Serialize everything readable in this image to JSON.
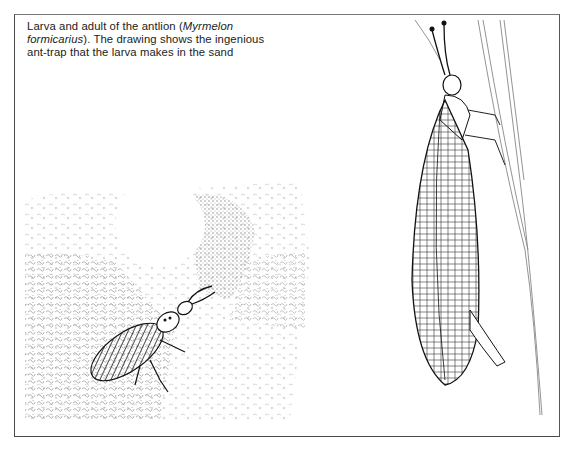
{
  "figure": {
    "caption": {
      "text_before_1": "Larva and adult of the antlion (",
      "species_italic_1": "Myrmelon",
      "species_italic_2": "formicarius",
      "text_after": "). The drawing shows the ingenious ant-trap that the larva makes in the sand"
    },
    "illustrations": [
      {
        "subject": "antlion larva in sand pit trap"
      },
      {
        "subject": "adult antlion on grass stem"
      }
    ]
  }
}
